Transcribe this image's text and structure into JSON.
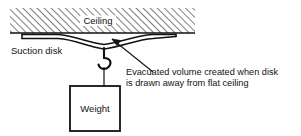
{
  "figure": {
    "width": 301,
    "height": 136,
    "background_color": "#ffffff",
    "line_color": "#111111"
  },
  "labels": {
    "ceiling": "Ceiling",
    "suction_disk": "Suction disk",
    "weight": "Weight",
    "annotation_line1": "Evacuated volume created when disk",
    "annotation_line2": "is drawn away from flat ceiling"
  },
  "parts": {
    "ceiling_block": {
      "name": "ceiling",
      "fill_pattern": "diagonal-hatch",
      "hatch_direction": "lower-left-to-upper-right",
      "hatch_spacing_px": 5,
      "x": 10,
      "y": 8,
      "width": 185,
      "height": 25
    },
    "suction_disk": {
      "name": "suction-disk",
      "shape": "shallow-dish",
      "left_x": 22,
      "right_x": 176,
      "top_y": 33,
      "lowest_y": 50
    },
    "hook": {
      "name": "hook",
      "stem_x": 104,
      "stem_top_y": 49,
      "hook_bottom_y": 70
    },
    "cord": {
      "name": "cord",
      "x": 104,
      "top_y": 70,
      "bottom_y": 86
    },
    "weight_box": {
      "name": "weight-box",
      "x": 70,
      "y": 86,
      "width": 50,
      "height": 45
    },
    "leader_arrow": {
      "name": "evacuated-volume-leader",
      "from_x": 152,
      "from_y": 72,
      "to_x": 112,
      "to_y": 40,
      "arrowhead": "at-top-left"
    }
  }
}
